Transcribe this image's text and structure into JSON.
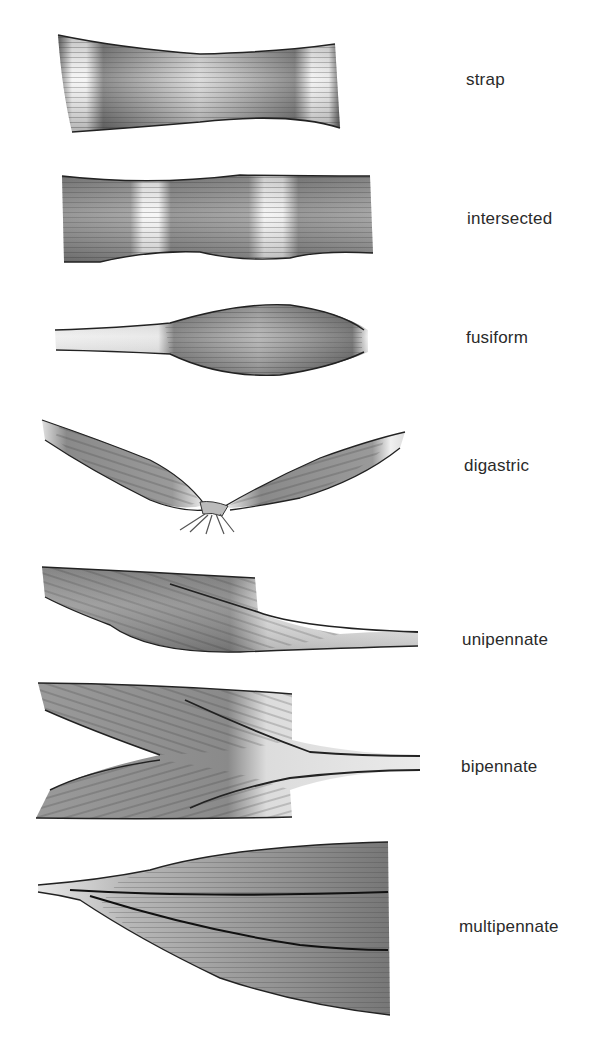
{
  "figure": {
    "muscles": [
      {
        "id": "strap",
        "label": "strap"
      },
      {
        "id": "intersected",
        "label": "intersected"
      },
      {
        "id": "fusiform",
        "label": "fusiform"
      },
      {
        "id": "digastric",
        "label": "digastric"
      },
      {
        "id": "unipennate",
        "label": "unipennate"
      },
      {
        "id": "bipennate",
        "label": "bipennate"
      },
      {
        "id": "multipennate",
        "label": "multipennate"
      }
    ]
  },
  "colors": {
    "background": "#ffffff",
    "muscle_dark": "#3a3a3a",
    "muscle_mid": "#8a8a8a",
    "tendon_light": "#f2f2f2",
    "label_text": "#2a2a2a"
  }
}
